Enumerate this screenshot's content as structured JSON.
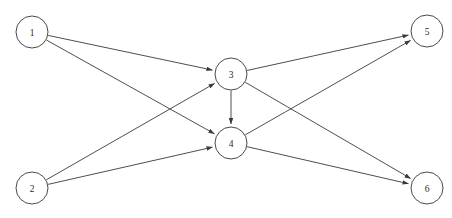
{
  "diagram": {
    "type": "directed-graph",
    "background_color": "#ffffff",
    "edge_color": "#3a3a3a",
    "node_stroke_color": "#4a4a4a",
    "node_fill_color": "#ffffff",
    "node_radius": 16,
    "nodes": [
      {
        "id": "1",
        "label": "1",
        "cx": 32,
        "cy": 32
      },
      {
        "id": "2",
        "label": "2",
        "cx": 32,
        "cy": 188
      },
      {
        "id": "3",
        "label": "3",
        "cx": 231,
        "cy": 74
      },
      {
        "id": "4",
        "label": "4",
        "cx": 231,
        "cy": 143
      },
      {
        "id": "5",
        "label": "5",
        "cx": 427,
        "cy": 31
      },
      {
        "id": "6",
        "label": "6",
        "cx": 427,
        "cy": 188
      }
    ],
    "edges": [
      {
        "from": "1",
        "to": "3",
        "directed": true
      },
      {
        "from": "1",
        "to": "4",
        "directed": true
      },
      {
        "from": "2",
        "to": "3",
        "directed": true
      },
      {
        "from": "2",
        "to": "4",
        "directed": true
      },
      {
        "from": "3",
        "to": "4",
        "directed": true
      },
      {
        "from": "3",
        "to": "5",
        "directed": true
      },
      {
        "from": "3",
        "to": "6",
        "directed": true
      },
      {
        "from": "4",
        "to": "5",
        "directed": true
      },
      {
        "from": "4",
        "to": "6",
        "directed": true
      }
    ]
  }
}
